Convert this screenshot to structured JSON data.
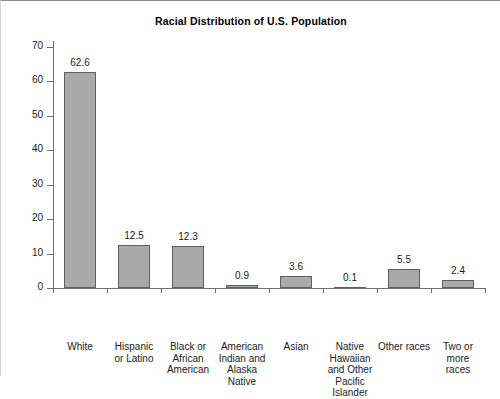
{
  "chart_data": {
    "type": "bar",
    "title": "Racial Distribution of U.S. Population",
    "xlabel": "",
    "ylabel": "",
    "ylim": [
      0,
      70
    ],
    "yticks": [
      0,
      10,
      20,
      30,
      40,
      50,
      60,
      70
    ],
    "grid": false,
    "legend": false,
    "bar_color": "#a9a9a9",
    "bar_border_color": "#5f5f5f",
    "axis_color": "#6e6e6e",
    "categories": [
      "White",
      "Hispanic or Latino",
      "Black or African American",
      "American Indian and Alaska Native",
      "Asian",
      "Native Hawaiian and Other Pacific Islander",
      "Other races",
      "Two or more races"
    ],
    "category_lines": [
      [
        "White"
      ],
      [
        "Hispanic",
        "or Latino"
      ],
      [
        "Black or",
        "African",
        "American"
      ],
      [
        "American",
        "Indian and",
        "Alaska",
        "Native"
      ],
      [
        "Asian"
      ],
      [
        "Native",
        "Hawaiian",
        "and Other",
        "Pacific",
        "Islander"
      ],
      [
        "Other races"
      ],
      [
        "Two or",
        "more",
        "races"
      ]
    ],
    "values": [
      62.6,
      12.5,
      12.3,
      0.9,
      3.6,
      0.1,
      5.5,
      2.4
    ],
    "value_labels": [
      "62.6",
      "12.5",
      "12.3",
      "0.9",
      "3.6",
      "0.1",
      "5.5",
      "2.4"
    ]
  }
}
